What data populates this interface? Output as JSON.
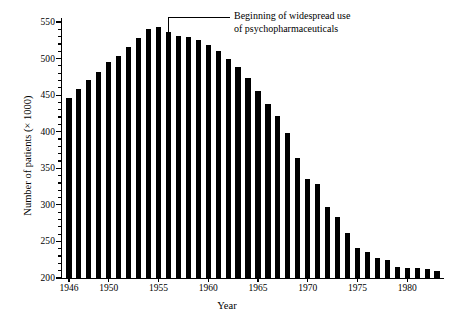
{
  "chart_data": {
    "type": "bar",
    "title": "",
    "xlabel": "Year",
    "ylabel": "Number of patients (× 1000)",
    "ylim": [
      200,
      550
    ],
    "xlim": [
      1945.3,
      1983.7
    ],
    "ytick_major": [
      200,
      250,
      300,
      350,
      400,
      450,
      500,
      550
    ],
    "ytick_minor_step": 10,
    "xtick_labels": [
      "1946",
      "1950",
      "1955",
      "1960",
      "1965",
      "1970",
      "1975",
      "1980"
    ],
    "xtick_values": [
      1946,
      1950,
      1955,
      1960,
      1965,
      1970,
      1975,
      1980
    ],
    "grid": false,
    "legend": null,
    "bar_color": "#000000",
    "categories": [
      1946,
      1947,
      1948,
      1949,
      1950,
      1951,
      1952,
      1953,
      1954,
      1955,
      1956,
      1957,
      1958,
      1959,
      1960,
      1961,
      1962,
      1963,
      1964,
      1965,
      1966,
      1967,
      1968,
      1969,
      1970,
      1971,
      1972,
      1973,
      1974,
      1975,
      1976,
      1977,
      1978,
      1979,
      1980,
      1981,
      1982,
      1983
    ],
    "values": [
      446,
      458,
      471,
      481,
      495,
      503,
      516,
      528,
      540,
      543,
      536,
      531,
      529,
      526,
      519,
      511,
      499,
      488,
      474,
      456,
      438,
      422,
      398,
      364,
      336,
      329,
      297,
      283,
      261,
      241,
      236,
      228,
      224,
      215,
      214,
      214,
      212,
      210
    ],
    "annotations": [
      {
        "text_line_1": "Beginning of widespread use",
        "text_line_2": "of psychopharmaceuticals",
        "points_to_year": 1956,
        "leader": "elbow"
      }
    ]
  }
}
